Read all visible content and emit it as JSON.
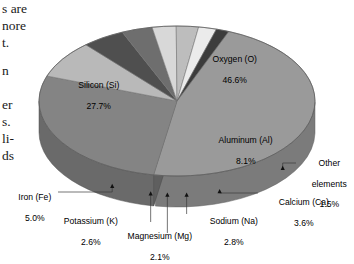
{
  "page": {
    "background": "#ffffff",
    "body_text_fragments": "s are\nnore\nt.\n\nn\n\ner\ns.\nli-\nds"
  },
  "chart_data": {
    "type": "pie",
    "title": "",
    "subtitle": "",
    "xlabel": "",
    "ylabel": "",
    "legend_position": "callout-labels",
    "grid": false,
    "three_d": true,
    "units": "percent",
    "categories": [
      "Oxygen (O)",
      "Silicon (Si)",
      "Aluminum (Al)",
      "Iron (Fe)",
      "Calcium (Ca)",
      "Sodium (Na)",
      "Potassium (K)",
      "Magnesium (Mg)",
      "Other elements"
    ],
    "values": [
      46.6,
      27.7,
      8.1,
      5.0,
      3.6,
      2.8,
      2.6,
      2.1,
      1.5
    ],
    "labels": [
      {
        "name": "Oxygen (O)",
        "value": "46.6%",
        "placement": "inside"
      },
      {
        "name": "Silicon (Si)",
        "value": "27.7%",
        "placement": "inside"
      },
      {
        "name": "Aluminum (Al)",
        "value": "8.1%",
        "placement": "inside"
      },
      {
        "name": "Iron (Fe)",
        "value": "5.0%",
        "placement": "callout-left"
      },
      {
        "name": "Potassium (K)",
        "value": "2.6%",
        "placement": "callout-bottom"
      },
      {
        "name": "Magnesium (Mg)",
        "value": "2.1%",
        "placement": "callout-bottom"
      },
      {
        "name": "Sodium (Na)",
        "value": "2.8%",
        "placement": "callout-bottom"
      },
      {
        "name": "Calcium (Ca)",
        "value": "3.6%",
        "placement": "callout-right"
      },
      {
        "name": "Other elements",
        "value": "1.5%",
        "placement": "callout-right"
      }
    ],
    "colors": [
      "#9a9a9a",
      "#848484",
      "#b9b9b9",
      "#4f4f4f",
      "#6e6e6e",
      "#d8d8d8",
      "#bdbdbd",
      "#ebebeb",
      "#3c3c3c"
    ]
  },
  "labels": {
    "oxygen": {
      "name": "Oxygen (O)",
      "value": "46.6%"
    },
    "silicon": {
      "name": "Silicon (Si)",
      "value": "27.7%"
    },
    "aluminum": {
      "name": "Aluminum (Al)",
      "value": "8.1%"
    },
    "other": {
      "name": "Other",
      "name2": "elements",
      "value": "1.5%"
    },
    "calcium": {
      "name": "Calcium (Ca)",
      "value": "3.6%"
    },
    "sodium": {
      "name": "Sodium (Na)",
      "value": "2.8%"
    },
    "magnesium": {
      "name": "Magnesium (Mg)",
      "value": "2.1%"
    },
    "potassium": {
      "name": "Potassium (K)",
      "value": "2.6%"
    },
    "iron": {
      "name": "Iron (Fe)",
      "value": "5.0%"
    }
  },
  "marginal_text": {
    "l1": "s are",
    "l2": "nore",
    "l3": "t.",
    "l4": "n",
    "l5": "er",
    "l6": "s.",
    "l7": "li-",
    "l8": "ds"
  }
}
